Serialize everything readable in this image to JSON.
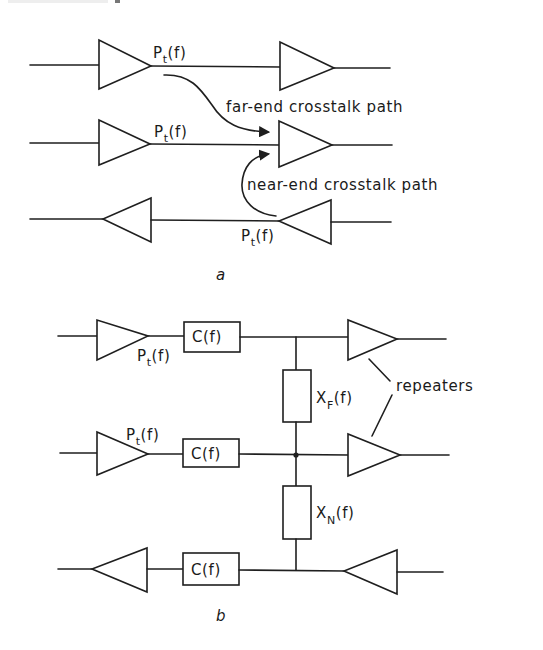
{
  "figure": {
    "panel_a": {
      "caption": "a",
      "signal_labels": [
        {
          "base": "P",
          "sub": "t",
          "arg": "(f)"
        },
        {
          "base": "P",
          "sub": "t",
          "arg": "(f)"
        },
        {
          "base": "P",
          "sub": "t",
          "arg": "(f)"
        }
      ],
      "far_end_label": "far-end crosstalk path",
      "near_end_label": "near-end crosstalk path"
    },
    "panel_b": {
      "caption": "b",
      "signal_labels": [
        {
          "base": "P",
          "sub": "t",
          "arg": "(f)"
        },
        {
          "base": "P",
          "sub": "t",
          "arg": "(f)"
        }
      ],
      "channel_boxes": [
        "C(f)",
        "C(f)",
        "C(f)"
      ],
      "far_end_coupling": {
        "base": "X",
        "sub": "F",
        "arg": "(f)"
      },
      "near_end_coupling": {
        "base": "X",
        "sub": "N",
        "arg": "(f)"
      },
      "repeaters_label": "repeaters"
    }
  },
  "colors": {
    "ink": "#1f1f1f",
    "background": "#ffffff"
  }
}
